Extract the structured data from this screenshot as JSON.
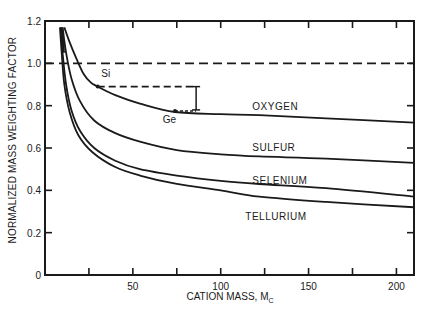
{
  "chart_data": {
    "type": "line",
    "title": "",
    "xlabel": "CATION MASS, M",
    "xlabel_subscript": "C",
    "ylabel": "NORMALIZED MASS WEIGHTING FACTOR",
    "xlim": [
      0,
      210
    ],
    "ylim": [
      0,
      1.2
    ],
    "x_ticks": [
      25,
      50,
      75,
      100,
      125,
      150,
      175,
      200
    ],
    "x_tick_labels": [
      {
        "value": 50,
        "label": "50"
      },
      {
        "value": 100,
        "label": "100"
      },
      {
        "value": 150,
        "label": "150"
      },
      {
        "value": 200,
        "label": "200"
      }
    ],
    "y_ticks": [
      0,
      0.2,
      0.4,
      0.6,
      0.8,
      1.0,
      1.2
    ],
    "y_tick_labels": [
      "0",
      "0.2",
      "0.4",
      "0.6",
      "0.8",
      "1.0",
      "1.2"
    ],
    "grid": false,
    "reference_line": {
      "y": 1.0,
      "style": "dashed"
    },
    "series": [
      {
        "name": "OXYGEN",
        "x": [
          11,
          14,
          18,
          22,
          26,
          30,
          40,
          54,
          74,
          100,
          122,
          160,
          210
        ],
        "y": [
          1.17,
          1.1,
          1.02,
          0.95,
          0.91,
          0.89,
          0.85,
          0.81,
          0.77,
          0.76,
          0.755,
          0.74,
          0.72
        ],
        "label_pos": {
          "x": 118,
          "y": 0.78
        }
      },
      {
        "name": "SULFUR",
        "x": [
          10,
          12,
          15,
          20,
          28,
          40,
          54,
          75,
          100,
          122,
          160,
          210
        ],
        "y": [
          1.17,
          1.05,
          0.93,
          0.82,
          0.73,
          0.67,
          0.63,
          0.59,
          0.57,
          0.56,
          0.55,
          0.53
        ],
        "label_pos": {
          "x": 118,
          "y": 0.585
        }
      },
      {
        "name": "SELENIUM",
        "x": [
          9,
          10,
          12,
          15,
          20,
          28,
          40,
          54,
          75,
          100,
          122,
          160,
          210
        ],
        "y": [
          1.17,
          1.05,
          0.9,
          0.78,
          0.68,
          0.6,
          0.54,
          0.5,
          0.47,
          0.445,
          0.43,
          0.41,
          0.37
        ],
        "label_pos": {
          "x": 118,
          "y": 0.43
        }
      },
      {
        "name": "TELLURIUM",
        "x": [
          8.5,
          9.5,
          11,
          14,
          19,
          27,
          40,
          54,
          75,
          100,
          122,
          160,
          210
        ],
        "y": [
          1.17,
          1.05,
          0.9,
          0.77,
          0.66,
          0.58,
          0.51,
          0.47,
          0.43,
          0.4,
          0.37,
          0.345,
          0.32
        ],
        "label_pos": {
          "x": 114,
          "y": 0.26
        }
      }
    ],
    "annotations": [
      {
        "text": "Si",
        "x": 30,
        "y": 0.89,
        "label_x": 32,
        "label_y": 0.935
      },
      {
        "text": "Ge",
        "x": 74,
        "y": 0.775,
        "label_x": 67,
        "label_y": 0.72
      },
      {
        "type": "dashed_hline",
        "x0": 30,
        "x1": 86,
        "y": 0.89
      },
      {
        "type": "error_bar",
        "x": 86,
        "y0": 0.89,
        "y1": 0.78
      }
    ]
  },
  "ylabel_text": "NORMALIZED MASS WEIGHTING FACTOR",
  "xlabel_text": "CATION MASS, M",
  "xlabel_sub": "C"
}
